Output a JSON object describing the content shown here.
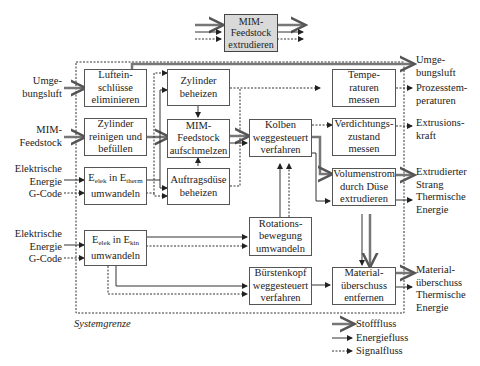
{
  "top_block": {
    "label": "MIM-\nFeedstock\nextrudieren"
  },
  "system_boundary_label": "Systemgrenze",
  "blocks": {
    "lufteinschluesse": "Luftein-\nschlüsse\neliminieren",
    "zylinder_reinigen": "Zylinder\nreinigen und\nbefüllen",
    "etherm": {
      "pre": "E",
      "sub1": "elek",
      "mid": " in E",
      "sub2": "therm",
      "line2": "umwandeln"
    },
    "ekin": {
      "pre": "E",
      "sub1": "elek",
      "mid": " in E",
      "sub2": "kin",
      "line2": "umwandeln"
    },
    "zylinder_beheizen": "Zylinder\nbeheizen",
    "feedstock_aufschmelzen": "MIM-\nFeedstock\naufschmelzen",
    "auftragsduese": "Auftragsdüse\nbeheizen",
    "kolben": "Kolben\nweggesteuert\nverfahren",
    "rotation": "Rotations-\nbewegung\numwandeln",
    "buerstenkopf": "Bürstenkopf\nweggesteuert\nverfahren",
    "temperaturen": "Tempe-\nraturen\nmessen",
    "verdichtung": "Verdichtungs-\nzustand\nmessen",
    "volumenstrom": "Volumenstrom\ndurch Düse\nextrudieren",
    "materialueberschuss": "Material-\nüberschuss\nentfernen"
  },
  "inputs": {
    "umgebungsluft": "Umge-\nbungsluft",
    "mim_feedstock": "MIM-\nFeedstock",
    "energie1": "Elektrische\nEnergie\nG-Code",
    "energie2": "Elektrische\nEnergie\nG-Code"
  },
  "outputs": {
    "umgebungsluft": "Umge-\nbungsluft",
    "prozesstemperaturen": "Prozesstem-\nperaturen",
    "extrusionskraft": "Extrusions-\nkraft",
    "strang": "Extrudierter\nStrang\nThermische\nEnergie",
    "material": "Material-\nüberschuss\nThermische\nEnergie"
  },
  "legend": {
    "stofffluss": "Stofffluss",
    "energiefluss": "Energiefluss",
    "signalfluss": "Signalfluss"
  },
  "colors": {
    "line": "#333333",
    "top_fill": "#d9d9d9",
    "stoff": "#777777"
  }
}
